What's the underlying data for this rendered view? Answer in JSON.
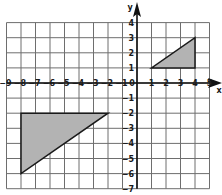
{
  "graph": {
    "x_min": -9,
    "x_max": 5,
    "y_min": -7,
    "y_max": 4,
    "x_axis_label": "x",
    "y_axis_label": "y",
    "origin_label": "0",
    "x_tick_labels": [
      "-9",
      "-8",
      "-7",
      "-6",
      "-5",
      "-4",
      "-3",
      "-2",
      "-1",
      "1",
      "2",
      "3",
      "4",
      "5"
    ],
    "y_tick_labels": [
      "4",
      "3",
      "2",
      "1",
      "-1",
      "-2",
      "-3",
      "-4",
      "-5",
      "-6",
      "-7"
    ],
    "colors": {
      "grid": "#6e6e6e",
      "axis": "#111111",
      "fill": "#b3b3b3",
      "stroke": "#1a1a1a"
    }
  },
  "shapes": [
    {
      "name": "large-triangle",
      "vertices": [
        [
          -8,
          -2
        ],
        [
          -2,
          -2
        ],
        [
          -8,
          -6
        ]
      ]
    },
    {
      "name": "small-triangle",
      "vertices": [
        [
          1,
          1
        ],
        [
          4,
          1
        ],
        [
          4,
          3
        ]
      ]
    }
  ]
}
